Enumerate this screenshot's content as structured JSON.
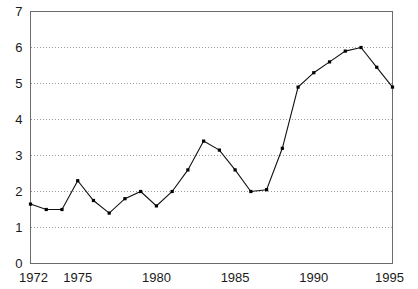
{
  "chart_data": {
    "type": "line",
    "title": "",
    "subtitle": "",
    "xlabel": "",
    "ylabel": "",
    "xlim": [
      1972,
      1995
    ],
    "ylim": [
      0,
      7
    ],
    "grid": "horizontal-dotted",
    "legend": "none",
    "marker": "square",
    "line_color": "#111111",
    "marker_color": "#000000",
    "grid_color": "#9a9a9a",
    "frame_color": "#6b6b6b",
    "x": [
      1972,
      1973,
      1974,
      1975,
      1976,
      1977,
      1978,
      1979,
      1980,
      1981,
      1982,
      1983,
      1984,
      1985,
      1986,
      1987,
      1988,
      1989,
      1990,
      1991,
      1992,
      1993,
      1994,
      1995
    ],
    "values": [
      1.65,
      1.5,
      1.5,
      2.3,
      1.75,
      1.4,
      1.8,
      2.0,
      1.6,
      2.0,
      2.6,
      3.4,
      3.15,
      2.6,
      2.0,
      2.05,
      3.2,
      4.9,
      5.3,
      5.6,
      5.9,
      6.0,
      5.45,
      4.9
    ],
    "xticks": [
      1972,
      1975,
      1980,
      1985,
      1990,
      1995
    ],
    "xtick_labels": [
      "1972",
      "1975",
      "1980",
      "1985",
      "1990",
      "1995"
    ],
    "yticks": [
      0,
      1,
      2,
      3,
      4,
      5,
      6,
      7
    ],
    "ytick_labels": [
      "0",
      "1",
      "2",
      "3",
      "4",
      "5",
      "6",
      "7"
    ],
    "gridline_values": [
      1,
      2,
      3,
      4,
      5,
      6
    ]
  }
}
